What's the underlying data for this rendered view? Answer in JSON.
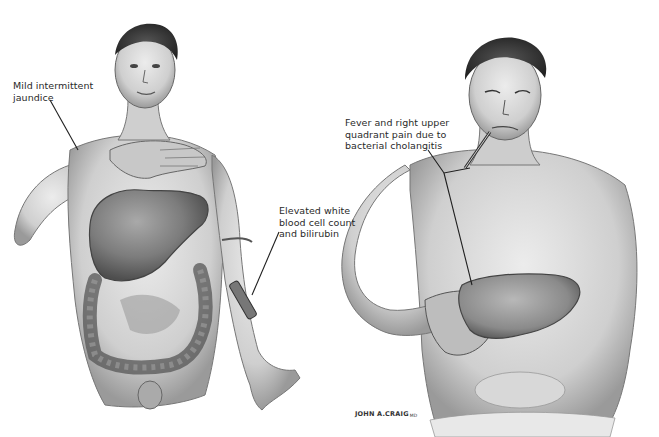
{
  "illustration": {
    "style": "grayscale pencil/watercolor medical illustration",
    "figures": [
      {
        "id": "left-figure",
        "description": "Standing man, hand on chest, with enlarged liver and colon shown in cutaway; IV tube/syringe on left forearm"
      },
      {
        "id": "right-figure",
        "description": "Man in distress, thermometer in mouth, hand pressing right upper quadrant; enlarged liver shown"
      }
    ],
    "labels": [
      {
        "id": "jaundice",
        "text": "Mild intermittent\njaundice"
      },
      {
        "id": "wbc",
        "text": "Elevated white\nblood cell count\nand bilirubin"
      },
      {
        "id": "fever",
        "text": "Fever and right upper\nquadrant pain due to\nbacterial cholangitis"
      }
    ],
    "signature": {
      "name": "JOHN A.CRAIG",
      "suffix": "MD"
    },
    "colors": {
      "background": "#ffffff",
      "ink": "#2a2a2a",
      "skin_light": "#d9d9d9",
      "skin_mid": "#a8a8a8",
      "organ_dark": "#6e6e6e"
    }
  }
}
